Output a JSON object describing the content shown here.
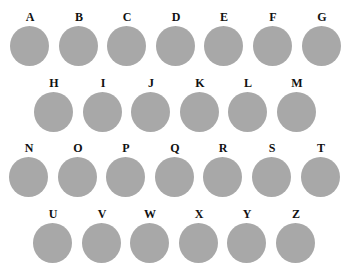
{
  "rows": [
    {
      "top": 11,
      "items": [
        {
          "letter": "A",
          "x": 10
        },
        {
          "letter": "B",
          "x": 59
        },
        {
          "letter": "C",
          "x": 107
        },
        {
          "letter": "D",
          "x": 156
        },
        {
          "letter": "E",
          "x": 204
        },
        {
          "letter": "F",
          "x": 253
        },
        {
          "letter": "G",
          "x": 302
        }
      ]
    },
    {
      "top": 77,
      "items": [
        {
          "letter": "H",
          "x": 34
        },
        {
          "letter": "I",
          "x": 83
        },
        {
          "letter": "J",
          "x": 131
        },
        {
          "letter": "K",
          "x": 180
        },
        {
          "letter": "L",
          "x": 228
        },
        {
          "letter": "M",
          "x": 277
        }
      ]
    },
    {
      "top": 142,
      "items": [
        {
          "letter": "N",
          "x": 9
        },
        {
          "letter": "O",
          "x": 58
        },
        {
          "letter": "P",
          "x": 106
        },
        {
          "letter": "Q",
          "x": 155
        },
        {
          "letter": "R",
          "x": 203
        },
        {
          "letter": "S",
          "x": 252
        },
        {
          "letter": "T",
          "x": 301
        }
      ]
    },
    {
      "top": 208,
      "items": [
        {
          "letter": "U",
          "x": 33
        },
        {
          "letter": "V",
          "x": 82
        },
        {
          "letter": "W",
          "x": 130
        },
        {
          "letter": "X",
          "x": 179
        },
        {
          "letter": "Y",
          "x": 227
        },
        {
          "letter": "Z",
          "x": 276
        }
      ]
    }
  ],
  "colors": {
    "circle": "#a8a8a8",
    "label": "#111111",
    "background": "#ffffff"
  }
}
